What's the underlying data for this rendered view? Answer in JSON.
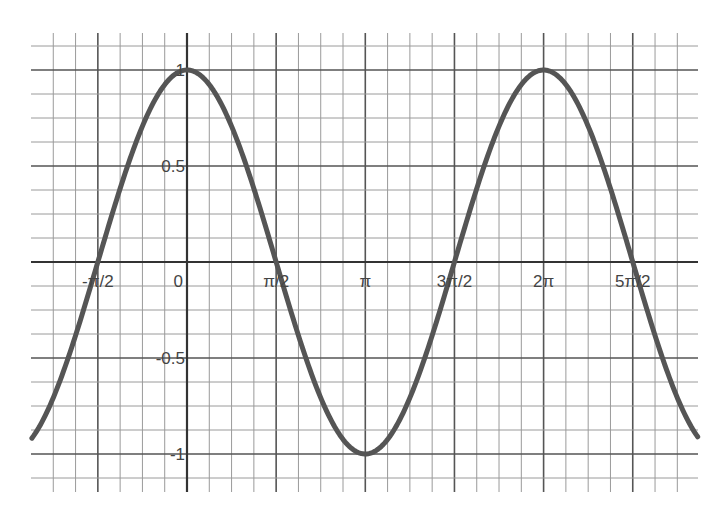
{
  "chart_data": {
    "type": "line",
    "title": "",
    "xlabel": "",
    "ylabel": "",
    "function": "y = cos(x)",
    "series": [
      {
        "name": "cos(x)",
        "color": "#555555",
        "x": [
          -2.733,
          -2.356,
          -1.963,
          -1.571,
          -1.178,
          -0.785,
          -0.393,
          0,
          0.393,
          0.785,
          1.178,
          1.571,
          1.963,
          2.356,
          2.749,
          3.142,
          3.534,
          3.927,
          4.32,
          4.712,
          5.105,
          5.498,
          5.89,
          6.283,
          6.676,
          7.069,
          7.461,
          7.854,
          8.247,
          8.639,
          8.998
        ],
        "values": [
          -0.917,
          -0.707,
          -0.383,
          0,
          0.383,
          0.707,
          0.924,
          1,
          0.924,
          0.707,
          0.383,
          0,
          -0.383,
          -0.707,
          -0.924,
          -1,
          -0.924,
          -0.707,
          -0.383,
          0,
          0.383,
          0.707,
          0.924,
          1,
          0.924,
          0.707,
          0.383,
          0,
          -0.383,
          -0.707,
          -0.906
        ]
      }
    ],
    "x_ticks": [
      {
        "value": -1.5708,
        "label": "-π/2"
      },
      {
        "value": 0,
        "label": "0"
      },
      {
        "value": 1.5708,
        "label": "π/2"
      },
      {
        "value": 3.1416,
        "label": "π"
      },
      {
        "value": 4.7124,
        "label": "3π/2"
      },
      {
        "value": 6.2832,
        "label": "2π"
      },
      {
        "value": 7.854,
        "label": "5π/2"
      }
    ],
    "y_ticks": [
      {
        "value": 1,
        "label": "1"
      },
      {
        "value": 0.5,
        "label": "0.5"
      },
      {
        "value": -0.5,
        "label": "-0.5"
      },
      {
        "value": -1,
        "label": "-1"
      }
    ],
    "xlim": [
      -2.733,
      8.998
    ],
    "ylim": [
      -1.125,
      1.125
    ],
    "grid": true,
    "grid_minor_step_x": "π/8",
    "grid_minor_step_y": 0.125,
    "legend": null
  },
  "layout": {
    "origin_px": [
      187,
      262
    ],
    "px_per_pi": 178.3,
    "px_per_unit_y": 192,
    "plot_left_px": 31,
    "plot_right_px": 698,
    "vgrid_index_range": [
      -6,
      22
    ],
    "hgrid_index_range": [
      -9,
      9
    ],
    "vgrid_top_px": 33,
    "vgrid_bottom_px": 492
  }
}
